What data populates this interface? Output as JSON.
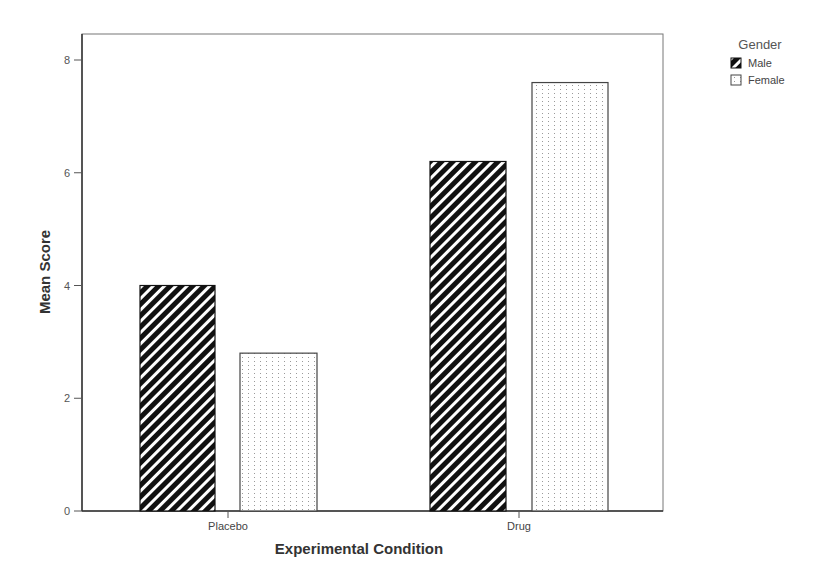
{
  "chart_data": {
    "type": "bar",
    "title": "",
    "xlabel": "Experimental Condition",
    "ylabel": "Mean Score",
    "categories": [
      "Placebo",
      "Drug"
    ],
    "series": [
      {
        "name": "Male",
        "values": [
          4.0,
          6.2
        ],
        "pattern": "diagonal-hatch",
        "color": "#1a1a1a"
      },
      {
        "name": "Female",
        "values": [
          2.8,
          7.6
        ],
        "pattern": "dotted",
        "color": "#ffffff"
      }
    ],
    "ylim": [
      0,
      8.45
    ],
    "yticks": [
      0,
      2,
      4,
      6,
      8
    ],
    "grid": false,
    "legend": {
      "title": "Gender",
      "position": "top-right-outside"
    }
  },
  "axis": {
    "x_title": "Experimental Condition",
    "y_title": "Mean Score",
    "y_ticks": [
      "0",
      "2",
      "4",
      "6",
      "8"
    ],
    "x_ticks": [
      "Placebo",
      "Drug"
    ]
  },
  "legend": {
    "title": "Gender",
    "items": [
      {
        "label": "Male"
      },
      {
        "label": "Female"
      }
    ]
  }
}
